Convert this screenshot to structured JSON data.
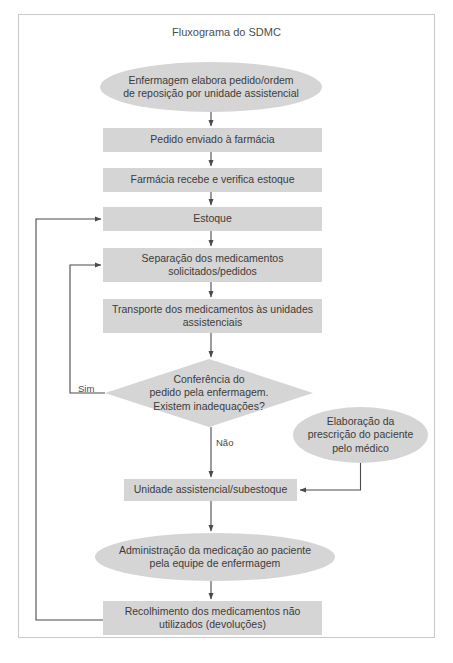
{
  "figure": {
    "title": "Fluxograma do SDMC",
    "border_color": "#c9c9c9",
    "shape_fill": "#d5d5d5",
    "text_color": "#3b3b3b",
    "line_color": "#5a5a5a"
  },
  "nodes": [
    {
      "id": "enfermagem",
      "shape": "ellipse",
      "label": "Enfermagem elabora pedido/ordem\nde reposição por unidade assistencial",
      "x": 100,
      "y": 62,
      "w": 222,
      "h": 50
    },
    {
      "id": "pedido-enviado",
      "shape": "rect",
      "label": "Pedido enviado à farmácia",
      "x": 103,
      "y": 128,
      "w": 219,
      "h": 24
    },
    {
      "id": "farmacia-recebe",
      "shape": "rect",
      "label": "Farmácia recebe e verifica estoque",
      "x": 103,
      "y": 168,
      "w": 219,
      "h": 24
    },
    {
      "id": "estoque",
      "shape": "rect",
      "label": "Estoque",
      "x": 103,
      "y": 207,
      "w": 219,
      "h": 24
    },
    {
      "id": "separacao",
      "shape": "rect",
      "label": "Separação dos medicamentos\nsolicitados/pedidos",
      "x": 103,
      "y": 248,
      "w": 219,
      "h": 34
    },
    {
      "id": "transporte",
      "shape": "rect",
      "label": "Transporte dos medicamentos às unidades\nassistenciais",
      "x": 103,
      "y": 299,
      "w": 219,
      "h": 34
    },
    {
      "id": "conferencia",
      "shape": "diamond",
      "label": "Conferência do\npedido pela enfermagem.\nExistem inadequações?",
      "x": 105,
      "y": 359,
      "w": 208,
      "h": 68
    },
    {
      "id": "prescricao",
      "shape": "ellipse",
      "label": "Elaboração da\nprescrição do paciente\npelo médico",
      "x": 293,
      "y": 407,
      "w": 135,
      "h": 56
    },
    {
      "id": "unidade-subestoque",
      "shape": "rect",
      "label": "Unidade assistencial/subestoque",
      "x": 124,
      "y": 479,
      "w": 173,
      "h": 22
    },
    {
      "id": "administracao",
      "shape": "ellipse",
      "label": "Administração da medicação ao paciente\npela equipe de enfermagem",
      "x": 95,
      "y": 533,
      "w": 240,
      "h": 48
    },
    {
      "id": "recolhimento",
      "shape": "rect",
      "label": "Recolhimento dos medicamentos não\nutilizados (devoluções)",
      "x": 103,
      "y": 601,
      "w": 219,
      "h": 34
    }
  ],
  "edge_labels": [
    {
      "id": "sim",
      "text": "Sim",
      "x": 78,
      "y": 383
    },
    {
      "id": "nao",
      "text": "Não",
      "x": 216,
      "y": 437
    }
  ],
  "edges": [
    {
      "from": "enfermagem",
      "to": "pedido-enviado",
      "kind": "vertical-arrow"
    },
    {
      "from": "pedido-enviado",
      "to": "farmacia-recebe",
      "kind": "vertical-arrow"
    },
    {
      "from": "farmacia-recebe",
      "to": "estoque",
      "kind": "vertical-arrow"
    },
    {
      "from": "estoque",
      "to": "separacao",
      "kind": "vertical-arrow"
    },
    {
      "from": "separacao",
      "to": "transporte",
      "kind": "vertical-arrow"
    },
    {
      "from": "transporte",
      "to": "conferencia",
      "kind": "vertical-arrow"
    },
    {
      "from": "conferencia",
      "to": "unidade-subestoque",
      "kind": "vertical-arrow",
      "label": "Não"
    },
    {
      "from": "conferencia",
      "to": "separacao",
      "kind": "loop-left-inner",
      "label": "Sim"
    },
    {
      "from": "prescricao",
      "to": "unidade-subestoque",
      "kind": "elbow-right"
    },
    {
      "from": "unidade-subestoque",
      "to": "administracao",
      "kind": "vertical-arrow"
    },
    {
      "from": "administracao",
      "to": "recolhimento",
      "kind": "vertical-arrow"
    },
    {
      "from": "recolhimento",
      "to": "estoque",
      "kind": "loop-left-outer"
    }
  ]
}
